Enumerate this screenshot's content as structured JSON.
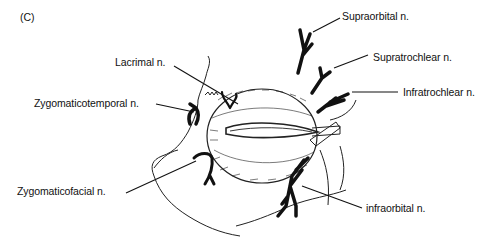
{
  "figure": {
    "panel_label": "(C)",
    "labels": {
      "supraorbital": "Supraorbital n.",
      "supratrochlear": "Supratrochlear n.",
      "infratrochlear": "Infratrochlear n.",
      "lacrimal": "Lacrimal n.",
      "zygomaticotemporal": "Zygomaticotemporal n.",
      "zygomaticofacial": "Zygomaticofacial n.",
      "infraorbital": "infraorbital n."
    }
  }
}
